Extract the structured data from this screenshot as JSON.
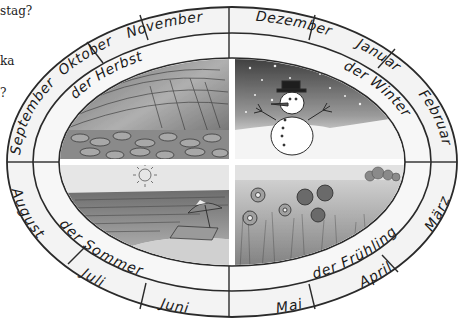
{
  "page_fragments": [
    {
      "text": "stag?",
      "y": 12
    },
    {
      "text": "ka",
      "y": 62
    },
    {
      "text": "?",
      "y": 94
    }
  ],
  "wheel": {
    "months": [
      {
        "id": "januar",
        "label": "Januar"
      },
      {
        "id": "februar",
        "label": "Februar"
      },
      {
        "id": "maerz",
        "label": "März"
      },
      {
        "id": "april",
        "label": "April"
      },
      {
        "id": "mai",
        "label": "Mai"
      },
      {
        "id": "juni",
        "label": "Juni"
      },
      {
        "id": "juli",
        "label": "Juli"
      },
      {
        "id": "august",
        "label": "August"
      },
      {
        "id": "september",
        "label": "September"
      },
      {
        "id": "oktober",
        "label": "Oktober"
      },
      {
        "id": "november",
        "label": "November"
      },
      {
        "id": "dezember",
        "label": "Dezember"
      }
    ],
    "seasons": [
      {
        "id": "herbst",
        "label": "der Herbst",
        "scene": "autumn-wind-leaves"
      },
      {
        "id": "winter",
        "label": "der Winter",
        "scene": "snowman-night-snow"
      },
      {
        "id": "sommer",
        "label": "der Sommer",
        "scene": "beach-sun-umbrella"
      },
      {
        "id": "fruehling",
        "label": "der Frühling",
        "scene": "flower-meadow"
      }
    ]
  },
  "colors": {
    "ring_fill": "#f2f2f2",
    "line": "#2a2a2a",
    "text": "#1a1a1a"
  }
}
